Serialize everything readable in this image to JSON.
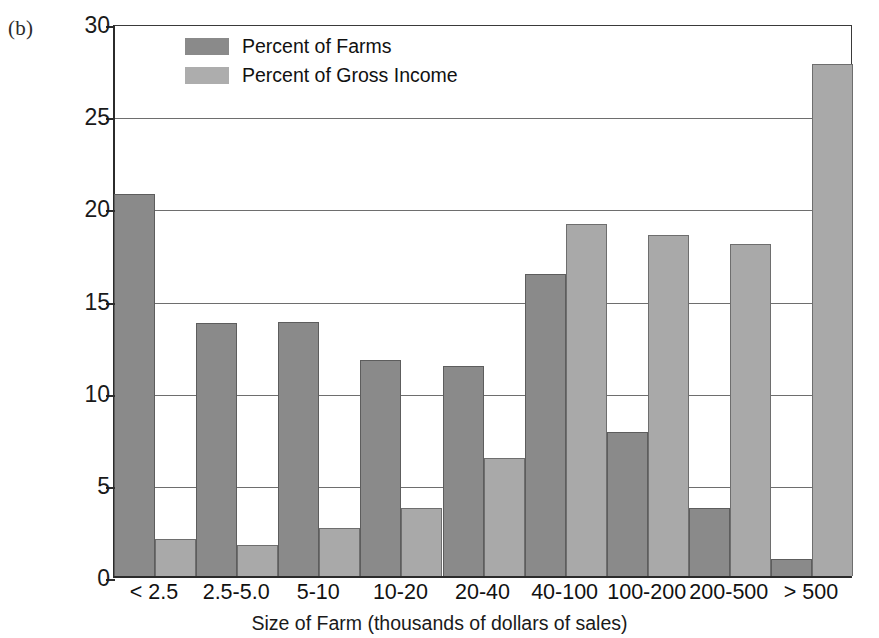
{
  "panel": {
    "label": "(b)"
  },
  "legend": {
    "position": "top-left-inside",
    "entries": [
      {
        "label": "Percent of Farms",
        "color": "#8a8a8a",
        "swatch": "legend-swatch-farms"
      },
      {
        "label": "Percent of Gross Income",
        "color": "#adadad",
        "swatch": "legend-swatch-income"
      }
    ]
  },
  "axes": {
    "y_title": "Percent Distributions",
    "x_title": "Size of Farm (thousands of dollars of sales)",
    "y_ticks": [
      "0",
      "5",
      "10",
      "15",
      "20",
      "25",
      "30"
    ]
  },
  "chart_data": {
    "type": "bar",
    "title": "",
    "subtitle": "",
    "xlabel": "Size of Farm (thousands of dollars of sales)",
    "ylabel": "Percent Distributions",
    "ylim": [
      0,
      30
    ],
    "yticks": [
      0,
      5,
      10,
      15,
      20,
      25,
      30
    ],
    "grid": true,
    "grid_axis": "y",
    "legend_position": "upper left inside",
    "categories": [
      "< 2.5",
      "2.5-5.0",
      "5-10",
      "10-20",
      "20-40",
      "40-100",
      "100-200",
      "200-500",
      "> 500"
    ],
    "series": [
      {
        "name": "Percent of Farms",
        "color": "#8a8a8a",
        "values": [
          20.7,
          13.7,
          13.8,
          11.7,
          11.4,
          16.4,
          7.8,
          3.7,
          0.9
        ]
      },
      {
        "name": "Percent of Gross Income",
        "color": "#a9a9a9",
        "values": [
          2.0,
          1.7,
          2.6,
          3.7,
          6.4,
          19.1,
          18.5,
          18.0,
          27.8
        ]
      }
    ]
  }
}
